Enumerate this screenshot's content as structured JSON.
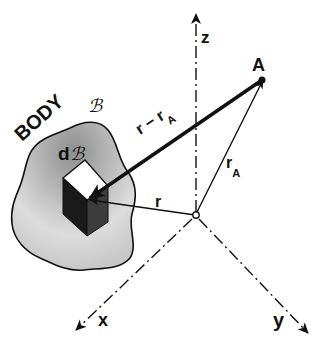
{
  "diagram": {
    "labels": {
      "body": "BODY",
      "body_symbol": "ℬ",
      "element": "d",
      "element_symbol": "ℬ",
      "point": "A",
      "axis_z": "z",
      "axis_x": "x",
      "axis_y": "y",
      "vec_r": "r",
      "vec_rA": "r",
      "vec_rA_sub": "A",
      "vec_diff": "r − r",
      "vec_diff_sub": "A"
    },
    "colors": {
      "ink": "#111111",
      "body_fill_light": "#e6e6e6",
      "body_fill_dark": "#9a9a9a",
      "cube_dark": "#1a1a1a",
      "cube_mid": "#3a3a3a",
      "cube_top": "#ffffff"
    }
  }
}
